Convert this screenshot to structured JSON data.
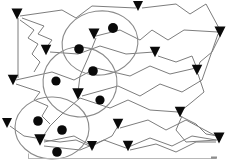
{
  "figure": {
    "title": "",
    "type": "node-link-graph",
    "canvas": {
      "width": 233,
      "height": 162
    },
    "background_color": "#ffffff",
    "edge_color": "#7d7d7d",
    "node_color": "#090909",
    "arrow_color": "#0a0a0a",
    "cluster_outline_color": "#8a8a8a",
    "axis_color": "#b8b8b8"
  },
  "counts": {
    "clusters": 3,
    "nodes": 8,
    "arrowheads": 16,
    "edges": 17
  },
  "clusters": [
    {
      "id": "cluster-top",
      "cx": 100,
      "cy": 43,
      "rx": 38,
      "ry": 32,
      "rotate": -8
    },
    {
      "id": "cluster-middle",
      "cx": 80,
      "cy": 82,
      "rx": 37,
      "ry": 35,
      "rotate": 4
    },
    {
      "id": "cluster-bottom",
      "cx": 52,
      "cy": 128,
      "rx": 37,
      "ry": 31,
      "rotate": 2
    }
  ],
  "nodes": [
    {
      "id": "n1",
      "cx": 113,
      "cy": 28,
      "r": 5.0,
      "cluster": "cluster-top"
    },
    {
      "id": "n2",
      "cx": 79,
      "cy": 49,
      "r": 4.8,
      "cluster": "cluster-top"
    },
    {
      "id": "n3",
      "cx": 93,
      "cy": 71,
      "r": 4.8,
      "cluster": "cluster-top"
    },
    {
      "id": "n4",
      "cx": 56,
      "cy": 81,
      "r": 4.6,
      "cluster": "cluster-middle"
    },
    {
      "id": "n5",
      "cx": 100,
      "cy": 100,
      "r": 4.6,
      "cluster": "cluster-middle"
    },
    {
      "id": "n6",
      "cx": 38,
      "cy": 121,
      "r": 4.8,
      "cluster": "cluster-bottom"
    },
    {
      "id": "n7",
      "cx": 62,
      "cy": 130,
      "r": 4.8,
      "cluster": "cluster-bottom"
    },
    {
      "id": "n8",
      "cx": 57,
      "cy": 152,
      "r": 4.8,
      "cluster": "cluster-bottom"
    }
  ],
  "arrowheads": [
    {
      "id": "a1",
      "x": 17,
      "y": 14,
      "size": 11.0
    },
    {
      "id": "a2",
      "x": 138,
      "y": 6,
      "size": 10.0
    },
    {
      "id": "a3",
      "x": 220,
      "y": 32,
      "size": 11.0
    },
    {
      "id": "a4",
      "x": 46,
      "y": 50,
      "size": 10.5
    },
    {
      "id": "a5",
      "x": 94,
      "y": 34,
      "size": 11.0
    },
    {
      "id": "a6",
      "x": 155,
      "y": 52,
      "size": 10.5
    },
    {
      "id": "a7",
      "x": 197,
      "y": 70,
      "size": 10.5
    },
    {
      "id": "a8",
      "x": 13,
      "y": 80,
      "size": 10.5
    },
    {
      "id": "a9",
      "x": 78,
      "y": 94,
      "size": 11.5
    },
    {
      "id": "a10",
      "x": 180,
      "y": 112,
      "size": 10.5
    },
    {
      "id": "a11",
      "x": 118,
      "y": 124,
      "size": 10.5
    },
    {
      "id": "a12",
      "x": 40,
      "y": 140,
      "size": 11.5
    },
    {
      "id": "a13",
      "x": 128,
      "y": 146,
      "size": 10.5
    },
    {
      "id": "a14",
      "x": 219,
      "y": 138,
      "size": 11.0
    },
    {
      "id": "a15",
      "x": 7,
      "y": 123,
      "size": 10.0
    },
    {
      "id": "a16",
      "x": 92,
      "y": 146,
      "size": 10.0
    }
  ],
  "edges": [
    {
      "id": "e1",
      "from": "a1",
      "to": "a2",
      "style": "zigzag"
    },
    {
      "id": "e2",
      "from": "a1",
      "to": "a8",
      "style": "straight"
    },
    {
      "id": "e3",
      "from": "a1",
      "to": "a4",
      "style": "zigzag"
    },
    {
      "id": "e4",
      "from": "a2",
      "to": "a3",
      "style": "zigzag"
    },
    {
      "id": "e5",
      "from": "a5",
      "to": "a3",
      "style": "zigzag"
    },
    {
      "id": "e6",
      "from": "a4",
      "to": "a6",
      "style": "straight"
    },
    {
      "id": "e7",
      "from": "a8",
      "to": "a7",
      "style": "zigzag"
    },
    {
      "id": "e8",
      "from": "a9",
      "to": "a3",
      "style": "zigzag"
    },
    {
      "id": "e9",
      "from": "a5",
      "to": "a9",
      "style": "straight"
    },
    {
      "id": "e10",
      "from": "a3",
      "to": "a7",
      "style": "zigzag"
    },
    {
      "id": "e11",
      "from": "a7",
      "to": "a10",
      "style": "zigzag"
    },
    {
      "id": "e12",
      "from": "a10",
      "to": "a14",
      "style": "zigzag"
    },
    {
      "id": "e13",
      "from": "a12",
      "to": "a11",
      "style": "straight"
    },
    {
      "id": "e14",
      "from": "a12",
      "to": "a14",
      "style": "zigzag"
    },
    {
      "id": "e15",
      "from": "a15",
      "to": "a12",
      "style": "straight"
    },
    {
      "id": "e16",
      "from": "a11",
      "to": "a14",
      "style": "zigzag"
    },
    {
      "id": "e17",
      "from": "a9",
      "to": "a12",
      "style": "straight"
    }
  ],
  "axis": {
    "visible": true,
    "y": 158,
    "x_start": 28,
    "x_end": 216,
    "label": ""
  }
}
